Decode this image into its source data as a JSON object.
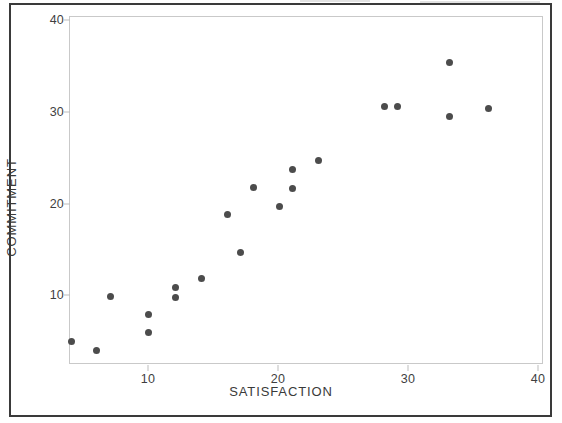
{
  "figure": {
    "background_color": "#ffffff",
    "border_color": "#3a3a3a",
    "plot_frame_color": "#c9c9c9",
    "point_color": "#4c4c4c"
  },
  "chart_data": {
    "type": "scatter",
    "title": "",
    "xlabel": "SATISFACTION",
    "ylabel": "COMMITMENT",
    "xlim": [
      1,
      41.5
    ],
    "ylim": [
      1.5,
      41
    ],
    "xticks": [
      10,
      20,
      30,
      40
    ],
    "yticks": [
      10,
      20,
      30,
      40
    ],
    "xtick_labels": [
      "10",
      "20",
      "30",
      "40"
    ],
    "ytick_labels": [
      "10",
      "20",
      "30",
      "40"
    ],
    "grid": false,
    "legend": null,
    "series": [
      {
        "name": "observations",
        "marker": "filled-circle",
        "color": "#4c4c4c",
        "x": [
          4.1,
          6.0,
          7.1,
          10.0,
          10.0,
          12.1,
          12.1,
          14.1,
          16.1,
          17.1,
          18.1,
          20.1,
          21.1,
          21.1,
          23.1,
          28.2,
          29.2,
          33.2,
          33.2,
          36.2
        ],
        "y": [
          5.0,
          4.0,
          9.9,
          7.9,
          5.9,
          10.9,
          9.8,
          11.8,
          18.8,
          14.7,
          21.8,
          19.7,
          21.7,
          23.7,
          24.7,
          30.6,
          30.6,
          35.4,
          29.5,
          30.4
        ]
      }
    ]
  }
}
